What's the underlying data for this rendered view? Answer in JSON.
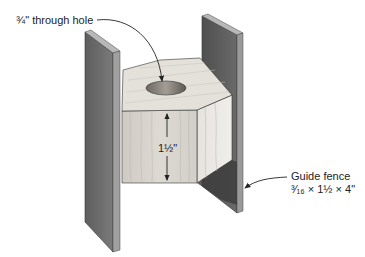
{
  "callouts": {
    "hole": "¾\" through hole",
    "height_dimension": "1½\"",
    "fence_title": "Guide fence",
    "fence_dims": "³⁄₁₆ × 1½ × 4\""
  },
  "parts": [
    "left-guide-fence",
    "hexagonal-block",
    "right-guide-fence"
  ],
  "colors": {
    "fence_face": "#6e6e6e",
    "fence_edge": "#9a9a9a",
    "fence_top": "#b8b8b8",
    "block_top": "#e4e0da",
    "block_front": "#d6d2cc",
    "block_side": "#e8e6e2",
    "hole": "#8a8580",
    "ink": "#222222"
  }
}
